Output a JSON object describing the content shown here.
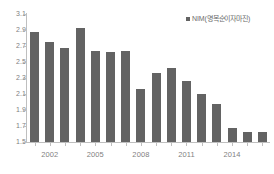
{
  "chart_data": {
    "type": "bar",
    "title": "",
    "xlabel": "",
    "ylabel": "",
    "legend": [
      "NIM(명목순이자마진)"
    ],
    "legend_position": "top-right",
    "grid": false,
    "ylim": [
      1.5,
      3.1
    ],
    "ytick_step": 0.2,
    "ytick_labels": [
      "3.1",
      "2.9",
      "2.7",
      "2.5",
      "2.3",
      "2.1",
      "1.9",
      "1.7",
      "1.5"
    ],
    "ytick_values": [
      3.1,
      2.9,
      2.7,
      2.5,
      2.3,
      2.1,
      1.9,
      1.7,
      1.5
    ],
    "categories": [
      2001,
      2002,
      2003,
      2004,
      2005,
      2006,
      2007,
      2008,
      2009,
      2010,
      2011,
      2012,
      2013,
      2014,
      2015,
      2016
    ],
    "xtick_labels": [
      "2002",
      "2005",
      "2008",
      "2011",
      "2014"
    ],
    "xtick_categories": [
      2002,
      2005,
      2008,
      2011,
      2014
    ],
    "series": [
      {
        "name": "NIM(명목순이자마진)",
        "color": "#636363",
        "values": [
          2.87,
          2.75,
          2.67,
          2.92,
          2.64,
          2.62,
          2.64,
          2.16,
          2.36,
          2.42,
          2.26,
          2.1,
          1.97,
          1.67,
          1.63,
          1.63
        ]
      }
    ]
  },
  "colors": {
    "bar": "#636363",
    "axis": "#bfbfbf",
    "tick_text": "#7f7f7f",
    "legend_text": "#6b6b6b",
    "background": "#ffffff"
  }
}
